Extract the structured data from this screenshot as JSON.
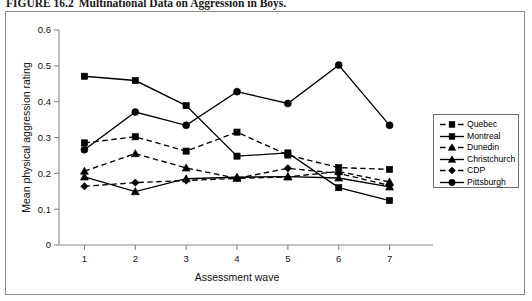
{
  "caption": {
    "number": "FIGURE 16.2",
    "text": "Multinational Data on Aggression in Boys."
  },
  "chart_data": {
    "type": "line",
    "title": "Multinational Data on Aggression in Boys.",
    "xlabel": "Assessment wave",
    "ylabel": "Mean physical aggression rating",
    "x": [
      1,
      2,
      3,
      4,
      5,
      6,
      7
    ],
    "xtick_labels": [
      "1",
      "2",
      "3",
      "4",
      "5",
      "6",
      "7"
    ],
    "ytick_labels": [
      "0",
      "0.1",
      "0.2",
      "0.3",
      "0.4",
      "0.5",
      "0.6"
    ],
    "ytick_values": [
      0,
      0.1,
      0.2,
      0.3,
      0.4,
      0.5,
      0.6
    ],
    "xlim": [
      0.5,
      7.5
    ],
    "ylim": [
      0,
      0.6
    ],
    "grid": false,
    "legend_position": "right",
    "series": [
      {
        "name": "Quebec",
        "marker": "square",
        "linestyle": "dashed",
        "color": "#000000",
        "values": [
          0.285,
          0.302,
          0.262,
          0.315,
          0.251,
          0.216,
          0.211
        ]
      },
      {
        "name": "Montreal",
        "marker": "square",
        "linestyle": "solid",
        "color": "#000000",
        "values": [
          0.471,
          0.459,
          0.389,
          0.248,
          0.257,
          0.16,
          0.124
        ]
      },
      {
        "name": "Dunedin",
        "marker": "triangle",
        "linestyle": "dashed",
        "color": "#000000",
        "values": [
          0.206,
          0.255,
          0.215,
          0.186,
          0.19,
          0.205,
          0.176
        ]
      },
      {
        "name": "Christchurch",
        "marker": "triangle",
        "linestyle": "solid",
        "color": "#000000",
        "values": [
          0.19,
          0.149,
          0.185,
          0.189,
          0.191,
          0.187,
          0.162
        ]
      },
      {
        "name": "CDP",
        "marker": "diamond",
        "linestyle": "dashed",
        "color": "#000000",
        "values": [
          0.164,
          0.174,
          0.18,
          0.186,
          0.214,
          0.2,
          0.166
        ]
      },
      {
        "name": "Pittsburgh",
        "marker": "circle",
        "linestyle": "solid",
        "color": "#000000",
        "values": [
          0.266,
          0.371,
          0.334,
          0.428,
          0.395,
          0.502,
          0.334
        ]
      }
    ]
  },
  "legend": {
    "items": [
      {
        "label": "Quebec"
      },
      {
        "label": "Montreal"
      },
      {
        "label": "Dunedin"
      },
      {
        "label": "Christchurch"
      },
      {
        "label": "CDP"
      },
      {
        "label": "Pittsburgh"
      }
    ]
  }
}
